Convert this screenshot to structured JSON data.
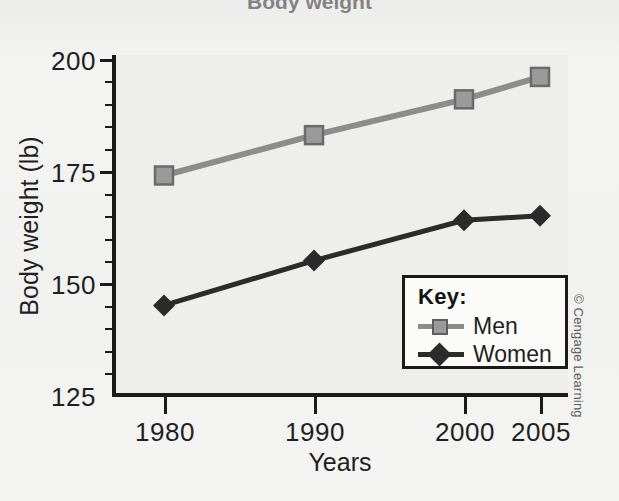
{
  "figure": {
    "title_partial": "Body weight",
    "credit": "© Cengage Learning"
  },
  "legend": {
    "title": "Key:",
    "entries": [
      {
        "label": "Men",
        "color": "#8c8c8c",
        "marker": "square"
      },
      {
        "label": "Women",
        "color": "#2b2b2b",
        "marker": "diamond"
      }
    ]
  },
  "axes": {
    "y_title": "Body weight (lb)",
    "x_title": "Years",
    "y_ticks": [
      "200",
      "175",
      "150",
      "125"
    ],
    "x_ticks": [
      "1980",
      "1990",
      "2000",
      "2005"
    ]
  },
  "chart_data": {
    "type": "line",
    "title": "Body weight",
    "xlabel": "Years",
    "ylabel": "Body weight (lb)",
    "categories": [
      "1980",
      "1990",
      "2000",
      "2005"
    ],
    "x": [
      1980,
      1990,
      2000,
      2005
    ],
    "xlim": [
      1980,
      2005
    ],
    "ylim": [
      125,
      200
    ],
    "y_major_ticks": [
      125,
      150,
      175,
      200
    ],
    "y_minor_tick_interval": 5,
    "grid": false,
    "legend_position": "inside-bottom-right",
    "series": [
      {
        "name": "Men",
        "color": "#8c8c8c",
        "marker": "square",
        "values": [
          174,
          183,
          191,
          196
        ]
      },
      {
        "name": "Women",
        "color": "#2b2b2b",
        "marker": "diamond",
        "values": [
          145,
          155,
          164,
          165
        ]
      }
    ]
  }
}
